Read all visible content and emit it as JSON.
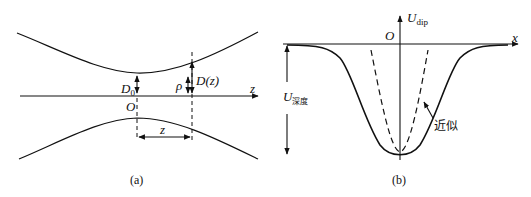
{
  "panel_a": {
    "caption": "(a)",
    "axis_label": "z",
    "origin_label": "O",
    "waist_label_main": "D",
    "waist_label_sub": "0",
    "radius_label": "ρ",
    "beam_radius_label": "D(z)",
    "distance_label": "z"
  },
  "panel_b": {
    "caption": "(b)",
    "x_axis_label": "x",
    "y_axis_label_main": "U",
    "y_axis_label_sub": "dip",
    "origin_label": "O",
    "depth_label_main": "U",
    "depth_label_sub": "深度",
    "approx_label": "近似"
  },
  "colors": {
    "line": "#111111",
    "background": "#ffffff"
  }
}
